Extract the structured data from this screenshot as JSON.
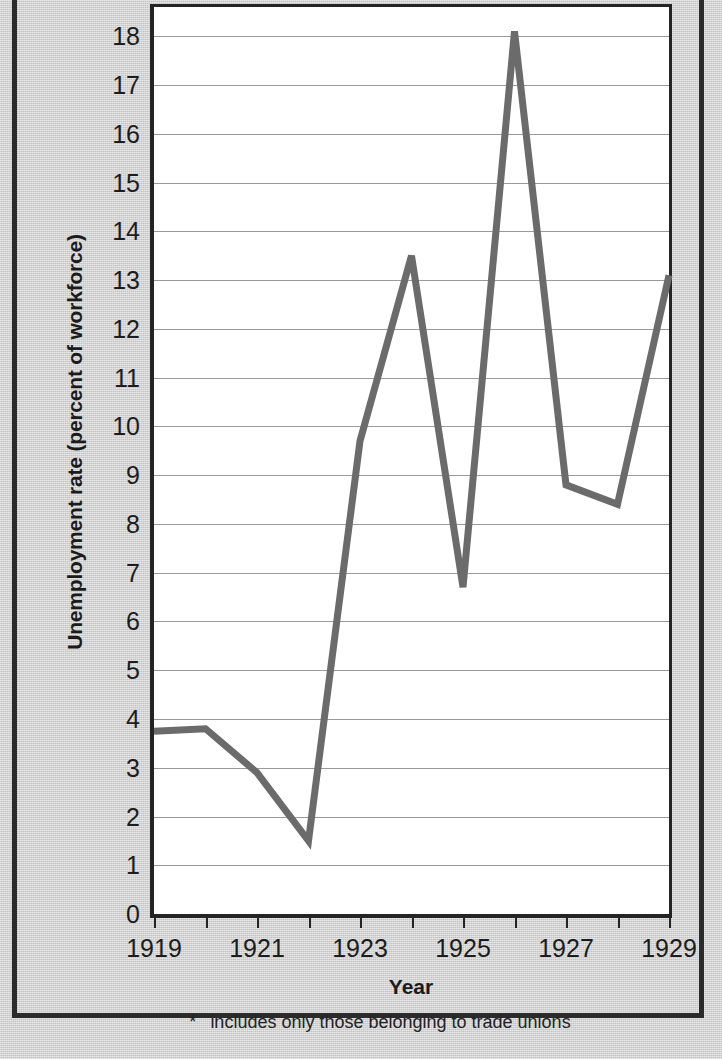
{
  "chart_data": {
    "type": "line",
    "title": "",
    "xlabel": "Year",
    "ylabel": "Unemployment rate (percent of workforce)",
    "footnote": "includes only those belonging to trade unions",
    "footnote_marker": "*",
    "x": [
      1919,
      1920,
      1921,
      1922,
      1923,
      1924,
      1925,
      1926,
      1927,
      1928,
      1929
    ],
    "values": [
      3.75,
      3.8,
      2.9,
      1.5,
      9.7,
      13.5,
      6.7,
      18.1,
      8.8,
      8.4,
      13.1
    ],
    "series": [
      {
        "name": "Unemployment rate",
        "values": [
          3.75,
          3.8,
          2.9,
          1.5,
          9.7,
          13.5,
          6.7,
          18.1,
          8.8,
          8.4,
          13.1
        ]
      }
    ],
    "xlim": [
      1919,
      1929
    ],
    "ylim": [
      0,
      18.6
    ],
    "y_ticks": [
      0,
      1,
      2,
      3,
      4,
      5,
      6,
      7,
      8,
      9,
      10,
      11,
      12,
      13,
      14,
      15,
      16,
      17,
      18
    ],
    "y_tick_labels": [
      "0",
      "1",
      "2",
      "3",
      "4",
      "5",
      "6",
      "7",
      "8",
      "9",
      "10",
      "11",
      "12",
      "13",
      "14",
      "15",
      "16",
      "17",
      "18"
    ],
    "x_ticks": [
      1919,
      1920,
      1921,
      1922,
      1923,
      1924,
      1925,
      1926,
      1927,
      1928,
      1929
    ],
    "x_tick_labels_shown": [
      "1919",
      "1921",
      "1923",
      "1925",
      "1927",
      "1929"
    ],
    "x_labeled_years": [
      1919,
      1921,
      1923,
      1925,
      1927,
      1929
    ],
    "grid": true,
    "grid_axis": "y",
    "legend": false,
    "line_color": "#6b6b6b",
    "grid_color": "#9a9a9a",
    "axis_color": "#242424",
    "plot_bg": "#ffffff",
    "page_bg": "#d2d2d2"
  }
}
